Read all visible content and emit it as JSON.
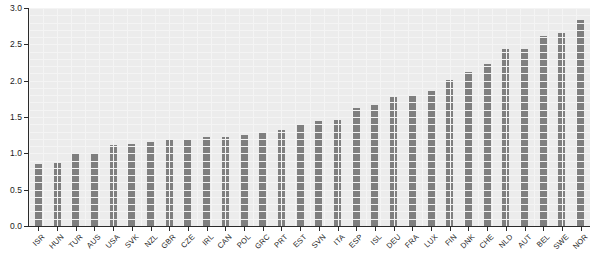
{
  "chart_data": {
    "type": "bar",
    "title": "",
    "subtitle": "",
    "xlabel": "",
    "ylabel": "",
    "ylim": [
      0.0,
      3.0
    ],
    "yticks": [
      "0.0",
      "0.5",
      "1.0",
      "1.5",
      "2.0",
      "2.5",
      "3.0"
    ],
    "ytick_values": [
      0.0,
      0.5,
      1.0,
      1.5,
      2.0,
      2.5,
      3.0
    ],
    "grid": true,
    "legend": "none",
    "bar_color": "#7f7f7f",
    "plot_background": "#ececec",
    "reference_line": {
      "value": 1.0,
      "color": "#000000",
      "label": ""
    },
    "categories": [
      "ISR",
      "HUN",
      "TUR",
      "AUS",
      "USA",
      "SVK",
      "NZL",
      "GBR",
      "CZE",
      "IRL",
      "CAN",
      "POL",
      "GRC",
      "PRT",
      "EST",
      "SVN",
      "ITA",
      "ESP",
      "ISL",
      "DEU",
      "FRA",
      "LUX",
      "FIN",
      "DNK",
      "CHE",
      "NLD",
      "AUT",
      "BEL",
      "SWE",
      "NOR"
    ],
    "values": [
      0.85,
      0.87,
      1.0,
      1.01,
      1.12,
      1.13,
      1.16,
      1.18,
      1.19,
      1.22,
      1.23,
      1.25,
      1.28,
      1.32,
      1.4,
      1.44,
      1.46,
      1.63,
      1.66,
      1.77,
      1.79,
      1.86,
      2.01,
      2.12,
      2.23,
      2.43,
      2.43,
      2.62,
      2.66,
      2.84
    ]
  }
}
